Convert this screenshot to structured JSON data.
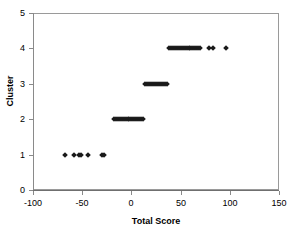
{
  "chart_data": {
    "type": "scatter",
    "title": "",
    "xlabel": "Total Score",
    "ylabel": "Cluster",
    "xlim": [
      -100,
      150
    ],
    "ylim": [
      0,
      5
    ],
    "xticks": [
      -100,
      -50,
      0,
      50,
      100,
      150
    ],
    "yticks": [
      0,
      1,
      2,
      3,
      4,
      5
    ],
    "xtick_labels": [
      "-100",
      "-50",
      "0",
      "50",
      "100",
      "150"
    ],
    "ytick_labels": [
      "0",
      "1",
      "2",
      "3",
      "4",
      "5"
    ],
    "grid": false,
    "legend": false,
    "marker": "diamond",
    "marker_color": "#1a1a1a",
    "series": [
      {
        "name": "Cluster assignment",
        "points": [
          {
            "x": -68,
            "y": 1
          },
          {
            "x": -58,
            "y": 1
          },
          {
            "x": -53,
            "y": 1
          },
          {
            "x": -51,
            "y": 1
          },
          {
            "x": -44,
            "y": 1
          },
          {
            "x": -30,
            "y": 1
          },
          {
            "x": -28,
            "y": 1
          },
          {
            "x": -18,
            "y": 2
          },
          {
            "x": -16,
            "y": 2
          },
          {
            "x": -14,
            "y": 2
          },
          {
            "x": -12,
            "y": 2
          },
          {
            "x": -10,
            "y": 2
          },
          {
            "x": -8,
            "y": 2
          },
          {
            "x": -6,
            "y": 2
          },
          {
            "x": -4,
            "y": 2
          },
          {
            "x": -2,
            "y": 2
          },
          {
            "x": 0,
            "y": 2
          },
          {
            "x": 2,
            "y": 2
          },
          {
            "x": 4,
            "y": 2
          },
          {
            "x": 6,
            "y": 2
          },
          {
            "x": 8,
            "y": 2
          },
          {
            "x": 10,
            "y": 2
          },
          {
            "x": 12,
            "y": 2
          },
          {
            "x": 14,
            "y": 3
          },
          {
            "x": 16,
            "y": 3
          },
          {
            "x": 18,
            "y": 3
          },
          {
            "x": 20,
            "y": 3
          },
          {
            "x": 22,
            "y": 3
          },
          {
            "x": 24,
            "y": 3
          },
          {
            "x": 26,
            "y": 3
          },
          {
            "x": 28,
            "y": 3
          },
          {
            "x": 30,
            "y": 3
          },
          {
            "x": 32,
            "y": 3
          },
          {
            "x": 34,
            "y": 3
          },
          {
            "x": 36,
            "y": 3
          },
          {
            "x": 38,
            "y": 4
          },
          {
            "x": 40,
            "y": 4
          },
          {
            "x": 42,
            "y": 4
          },
          {
            "x": 44,
            "y": 4
          },
          {
            "x": 46,
            "y": 4
          },
          {
            "x": 48,
            "y": 4
          },
          {
            "x": 50,
            "y": 4
          },
          {
            "x": 52,
            "y": 4
          },
          {
            "x": 54,
            "y": 4
          },
          {
            "x": 56,
            "y": 4
          },
          {
            "x": 58,
            "y": 4
          },
          {
            "x": 60,
            "y": 4
          },
          {
            "x": 62,
            "y": 4
          },
          {
            "x": 64,
            "y": 4
          },
          {
            "x": 66,
            "y": 4
          },
          {
            "x": 68,
            "y": 4
          },
          {
            "x": 70,
            "y": 4
          },
          {
            "x": 79,
            "y": 4
          },
          {
            "x": 83,
            "y": 4
          },
          {
            "x": 96,
            "y": 4
          }
        ]
      }
    ]
  }
}
